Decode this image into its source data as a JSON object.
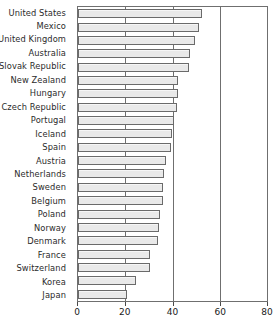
{
  "chart_data": {
    "type": "bar",
    "orientation": "horizontal",
    "title": "",
    "subtitle": "",
    "xlabel": "",
    "ylabel": "",
    "xlim": [
      0,
      80
    ],
    "grid": true,
    "legend": null,
    "xticks": [
      0,
      20,
      40,
      60,
      80
    ],
    "xtick_labels": [
      "0",
      "20",
      "40",
      "60",
      "80"
    ],
    "categories": [
      "United States",
      "Mexico",
      "United Kingdom",
      "Australia",
      "Slovak Republic",
      "New Zealand",
      "Hungary",
      "Czech Republic",
      "Portugal",
      "Iceland",
      "Spain",
      "Austria",
      "Netherlands",
      "Sweden",
      "Belgium",
      "Poland",
      "Norway",
      "Denmark",
      "France",
      "Switzerland",
      "Korea",
      "Japan"
    ],
    "values": [
      52,
      50.5,
      49,
      47,
      46.5,
      42,
      42,
      41.5,
      40,
      39.5,
      39,
      37,
      36,
      35.5,
      35.5,
      34.5,
      34,
      33.5,
      30,
      30,
      24.5,
      20.5
    ],
    "bar_color": "#e9e9e9",
    "bar_border_color": "#6a6a6a",
    "axis_color": "#6f6f6f"
  }
}
